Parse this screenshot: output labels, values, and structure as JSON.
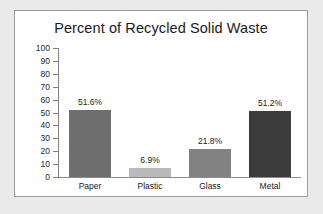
{
  "chart_data": {
    "type": "bar",
    "title": "Percent of Recycled Solid Waste",
    "xlabel": "",
    "ylabel": "",
    "categories": [
      "Paper",
      "Plastic",
      "Glass",
      "Metal"
    ],
    "values": [
      51.6,
      6.9,
      21.8,
      51.2
    ],
    "data_labels": [
      "51.6%",
      "6.9%",
      "21.8%",
      "51.2%"
    ],
    "bar_colors": [
      "#6e6e6e",
      "#b9b9b9",
      "#828282",
      "#3b3b3b"
    ],
    "ylim": [
      0,
      100
    ],
    "ytick_labels": [
      "100",
      "90",
      "80",
      "70",
      "60",
      "50",
      "40",
      "30",
      "20",
      "10",
      "0"
    ],
    "ytick_values": [
      100,
      90,
      80,
      70,
      60,
      50,
      40,
      30,
      20,
      10,
      0
    ],
    "grid": false,
    "legend": false,
    "legend_position": "none"
  },
  "figure": {
    "panel_background": "#ffffff",
    "panel_border_color": "#9b9b9b",
    "page_background": "#eaeaea",
    "axis_color": "#808080",
    "text_color": "#1a1a1a"
  }
}
